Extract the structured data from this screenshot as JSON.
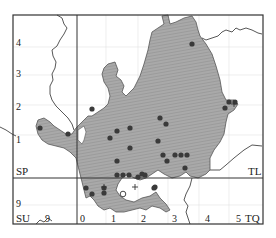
{
  "map": {
    "type": "distribution-map",
    "grid_squares": {
      "SP": "SP",
      "TL": "TL",
      "SU": "SU",
      "TQ": "TQ"
    },
    "left_axis_ticks": [
      "4",
      "3",
      "2",
      "1",
      "9"
    ],
    "bottom_axis_ticks": [
      "9",
      "0",
      "1",
      "2",
      "3",
      "4",
      "5"
    ],
    "colors": {
      "region_fill": "#a8a8a8",
      "region_stroke": "#555555",
      "border": "#333333",
      "grid_faint": "#dddddd",
      "dot": "#3a3a3a",
      "background": "#ffffff"
    },
    "markers": {
      "filled_dots": 33,
      "open_circles": 1,
      "plus_signs": 3
    }
  }
}
